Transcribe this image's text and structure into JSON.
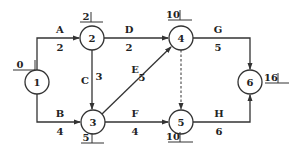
{
  "diagram": {
    "type": "activity-on-arrow network",
    "nodes": [
      {
        "id": "1",
        "label": "1",
        "time": "0",
        "cx": 37,
        "cy": 82
      },
      {
        "id": "2",
        "label": "2",
        "time": "2",
        "cx": 92,
        "cy": 38
      },
      {
        "id": "3",
        "label": "3",
        "time": "5",
        "cx": 93,
        "cy": 122
      },
      {
        "id": "4",
        "label": "4",
        "time": "10",
        "cx": 181,
        "cy": 38
      },
      {
        "id": "5",
        "label": "5",
        "time": "10",
        "cx": 181,
        "cy": 122
      },
      {
        "id": "6",
        "label": "6",
        "time": "16",
        "cx": 250,
        "cy": 82
      }
    ],
    "edges": [
      {
        "activity": "A",
        "duration": "2",
        "from": "1",
        "to": "2"
      },
      {
        "activity": "B",
        "duration": "4",
        "from": "1",
        "to": "3"
      },
      {
        "activity": "C",
        "duration": "3",
        "from": "2",
        "to": "3"
      },
      {
        "activity": "D",
        "duration": "2",
        "from": "2",
        "to": "4"
      },
      {
        "activity": "E",
        "duration": "5",
        "from": "3",
        "to": "4"
      },
      {
        "activity": "F",
        "duration": "4",
        "from": "3",
        "to": "5"
      },
      {
        "activity": "G",
        "duration": "5",
        "from": "4",
        "to": "6"
      },
      {
        "activity": "H",
        "duration": "6",
        "from": "5",
        "to": "6"
      },
      {
        "activity": "",
        "duration": "",
        "from": "4",
        "to": "5",
        "dummy": true
      }
    ]
  },
  "labels": {
    "n1": "1",
    "n2": "2",
    "n3": "3",
    "n4": "4",
    "n5": "5",
    "n6": "6",
    "t1": "0",
    "t2": "2",
    "t3": "5",
    "t4": "10",
    "t5": "10",
    "t6": "16",
    "A": "A",
    "A_d": "2",
    "B": "B",
    "B_d": "4",
    "C": "C",
    "C_d": "3",
    "D": "D",
    "D_d": "2",
    "E": "E",
    "E_d": "5",
    "F": "F",
    "F_d": "4",
    "G": "G",
    "G_d": "5",
    "H": "H",
    "H_d": "6"
  }
}
